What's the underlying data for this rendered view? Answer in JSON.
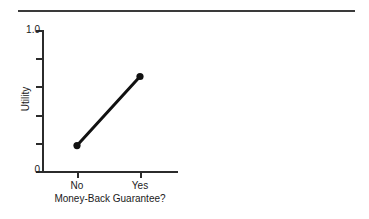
{
  "figure": {
    "top_rule": true,
    "background_color": "#ffffff",
    "ink_color": "#1a1a1a"
  },
  "chart_data": {
    "type": "line",
    "title": "",
    "subtitle": "",
    "xlabel": "Money-Back Guarantee?",
    "ylabel": "Utility",
    "categories": [
      "No",
      "Yes"
    ],
    "values": [
      0.18,
      0.67
    ],
    "series": [
      {
        "name": "Utility",
        "values": [
          0.18,
          0.67
        ],
        "marker": "filled-circle",
        "line_color": "#111111",
        "line_width": 3
      }
    ],
    "ylim": [
      0,
      1.0
    ],
    "ytick_labels": [
      "0",
      "1.0"
    ],
    "ytick_values": [
      0,
      1.0
    ],
    "yticks_minor": [
      0.2,
      0.4,
      0.6,
      0.8
    ],
    "xtick_labels": [
      "No",
      "Yes"
    ],
    "grid": false,
    "legend": "none",
    "annotations": []
  },
  "axis": {
    "y_top_label": "1.0",
    "y_bottom_label": "0",
    "y_title": "Utility",
    "x_title": "Money-Back Guarantee?",
    "x_labels": [
      "No",
      "Yes"
    ]
  }
}
